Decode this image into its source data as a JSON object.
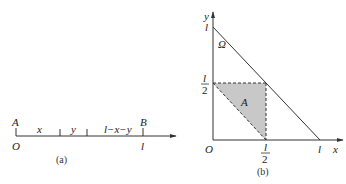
{
  "figure_a": {
    "caption": "(a)",
    "point_A": "A",
    "point_B": "B",
    "origin": "O",
    "end": "l",
    "segments": [
      "x",
      "y",
      "l−x−y"
    ]
  },
  "figure_b": {
    "caption": "(b)",
    "axis_x": "x",
    "axis_y": "y",
    "origin": "O",
    "region_omega": "Ω",
    "region_A": "A",
    "x_tick_half_num": "l",
    "x_tick_half_den": "2",
    "x_tick_full": "l",
    "y_tick_half_num": "l",
    "y_tick_half_den": "2",
    "y_tick_full": "l"
  },
  "colors": {
    "line": "#333333",
    "shade": "#c8c8c8"
  }
}
